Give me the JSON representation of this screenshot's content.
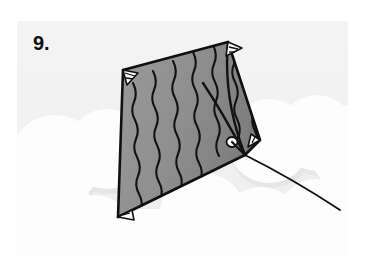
{
  "figure": {
    "step_label": "9.",
    "caption": "",
    "type": "instructional-illustration"
  },
  "colors": {
    "panel_background": "#f2f2f2",
    "page_background": "#ffffff",
    "cloud_fill": "#fefefe",
    "cloud_shadow": "#e4e4e4",
    "sail_fill": "#8f8f8f",
    "sail_fill_shadow": "#7e7e7e",
    "line_stroke": "#101010",
    "patch_fill": "#ffffff",
    "number_color": "#101010"
  },
  "scene": {
    "panel": {
      "x": 17,
      "y": 21,
      "width": 331,
      "height": 234
    },
    "clouds": [
      {
        "name": "cloud-left-lower",
        "cx": 38,
        "cy": 140,
        "r": 46
      },
      {
        "name": "cloud-left-mid",
        "cx": 90,
        "cy": 128,
        "r": 40
      },
      {
        "name": "cloud-left-base",
        "cx": 20,
        "cy": 175,
        "r": 52
      },
      {
        "name": "cloud-right-upper",
        "cx": 252,
        "cy": 120,
        "r": 42
      },
      {
        "name": "cloud-right-mid",
        "cx": 300,
        "cy": 112,
        "r": 38
      },
      {
        "name": "cloud-far-right",
        "cx": 336,
        "cy": 128,
        "r": 44
      },
      {
        "name": "cloud-bottom-center",
        "cx": 186,
        "cy": 196,
        "r": 44
      },
      {
        "name": "cloud-bottom-right",
        "cx": 244,
        "cy": 206,
        "r": 40
      },
      {
        "name": "cloud-bottom-far-right",
        "cx": 300,
        "cy": 200,
        "r": 42
      },
      {
        "name": "cloud-bottom-left",
        "cx": 78,
        "cy": 212,
        "r": 38
      }
    ],
    "kite": {
      "corners": {
        "top_left": {
          "x": 106,
          "y": 49
        },
        "top_right": {
          "x": 211,
          "y": 21
        },
        "right": {
          "x": 243,
          "y": 119
        },
        "bottom": {
          "x": 101,
          "y": 196
        }
      },
      "bridle_point": {
        "x": 228,
        "y": 134
      },
      "reinforcement_patches": [
        {
          "name": "patch-top-left",
          "x": 106,
          "y": 49
        },
        {
          "name": "patch-top-right",
          "x": 211,
          "y": 21
        },
        {
          "name": "patch-right",
          "x": 243,
          "y": 119
        },
        {
          "name": "patch-bottom",
          "x": 101,
          "y": 196
        },
        {
          "name": "patch-bridle",
          "x": 215,
          "y": 120
        }
      ],
      "diagonal_wavy_lines": 9,
      "spine_lines": 2,
      "string_end": {
        "x": 323,
        "y": 189
      }
    }
  }
}
